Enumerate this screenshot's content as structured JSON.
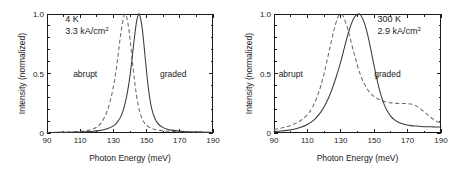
{
  "figure": {
    "panel_count": 2,
    "background": "#ffffff"
  },
  "chart_data": [
    {
      "type": "line",
      "panel": "left",
      "title": "",
      "xlabel": "Photon Energy (meV)",
      "ylabel": "Intensity (normalized)",
      "xlim": [
        90,
        190
      ],
      "ylim": [
        0,
        1.0
      ],
      "xticks": [
        90,
        110,
        130,
        150,
        170,
        190
      ],
      "xticklabels": [
        "90",
        "110",
        "130",
        "150",
        "170",
        "190"
      ],
      "yticks": [
        0,
        0.5,
        1.0
      ],
      "yticklabels": [
        "0",
        "0.5",
        "1.0"
      ],
      "minor_ticks": true,
      "grid": false,
      "legend": "inline-annotations",
      "annotations": [
        {
          "text_line1": "4 K",
          "text_line2_base": "3.3 kA/cm",
          "text_line2_sup": "2",
          "x": 101,
          "y": 0.93
        },
        {
          "text": "abrupt",
          "x": 113,
          "y": 0.5
        },
        {
          "text": "graded",
          "x": 166,
          "y": 0.5
        }
      ],
      "series": [
        {
          "name": "abrupt",
          "style": "dashed",
          "color": "#6a6a6a",
          "peak_x": 137.0,
          "peak_y": 1.0,
          "x": [
            90,
            95,
            100,
            105,
            110,
            113,
            116,
            118,
            120,
            122,
            124,
            126,
            128,
            130,
            132,
            134,
            135,
            136,
            137,
            138,
            139,
            140,
            141,
            142,
            143,
            144,
            145,
            146,
            147,
            148,
            149,
            150,
            152,
            154,
            156,
            158,
            160,
            163,
            166,
            170,
            175,
            180,
            185,
            190
          ],
          "y": [
            0.005,
            0.006,
            0.008,
            0.01,
            0.014,
            0.018,
            0.026,
            0.035,
            0.05,
            0.075,
            0.115,
            0.175,
            0.265,
            0.39,
            0.565,
            0.79,
            0.885,
            0.96,
            1.0,
            0.975,
            0.9,
            0.79,
            0.66,
            0.53,
            0.41,
            0.31,
            0.23,
            0.172,
            0.13,
            0.1,
            0.079,
            0.064,
            0.045,
            0.034,
            0.027,
            0.022,
            0.019,
            0.015,
            0.013,
            0.011,
            0.009,
            0.008,
            0.007,
            0.006
          ]
        },
        {
          "name": "graded",
          "style": "solid",
          "color": "#3a3a3a",
          "peak_x": 145.5,
          "peak_y": 1.0,
          "x": [
            90,
            95,
            100,
            105,
            110,
            114,
            118,
            121,
            124,
            127,
            130,
            132,
            134,
            136,
            138,
            140,
            142,
            143,
            144,
            145,
            145.5,
            146,
            147,
            148,
            149,
            150,
            151,
            152,
            153,
            154,
            155,
            156,
            158,
            160,
            162,
            165,
            168,
            172,
            176,
            180,
            185,
            190
          ],
          "y": [
            0.004,
            0.005,
            0.006,
            0.007,
            0.009,
            0.011,
            0.015,
            0.02,
            0.028,
            0.04,
            0.06,
            0.085,
            0.125,
            0.195,
            0.31,
            0.48,
            0.72,
            0.84,
            0.94,
            0.995,
            1.0,
            0.985,
            0.915,
            0.8,
            0.655,
            0.51,
            0.385,
            0.285,
            0.21,
            0.158,
            0.122,
            0.096,
            0.063,
            0.045,
            0.034,
            0.024,
            0.018,
            0.013,
            0.01,
            0.008,
            0.007,
            0.006
          ]
        }
      ]
    },
    {
      "type": "line",
      "panel": "right",
      "title": "",
      "xlabel": "Photon Energy (meV)",
      "ylabel": "Intensity (normalized)",
      "xlim": [
        90,
        190
      ],
      "ylim": [
        0,
        1.0
      ],
      "xticks": [
        90,
        110,
        130,
        150,
        170,
        190
      ],
      "xticklabels": [
        "90",
        "110",
        "130",
        "150",
        "170",
        "190"
      ],
      "yticks": [
        0,
        0.5,
        1.0
      ],
      "yticklabels": [
        "0",
        "0.5",
        "1.0"
      ],
      "minor_ticks": true,
      "grid": false,
      "legend": "inline-annotations",
      "annotations": [
        {
          "text_line1": "300 K",
          "text_line2_base": "2.9 kA/cm",
          "text_line2_sup": "2",
          "x": 152,
          "y": 0.93
        },
        {
          "text": "abrupt",
          "x": 100,
          "y": 0.5
        },
        {
          "text": "graded",
          "x": 158,
          "y": 0.5
        }
      ],
      "series": [
        {
          "name": "abrupt",
          "style": "dashed",
          "color": "#6a6a6a",
          "peak_x": 130.0,
          "peak_y": 1.0,
          "shoulder_x": 170,
          "shoulder_y": 0.25,
          "x": [
            90,
            94,
            98,
            102,
            106,
            110,
            113,
            116,
            118,
            120,
            122,
            124,
            126,
            128,
            129,
            130,
            131,
            132,
            134,
            136,
            138,
            140,
            142,
            144,
            146,
            148,
            150,
            152,
            154,
            156,
            158,
            160,
            163,
            166,
            169,
            172,
            175,
            178,
            181,
            184,
            187,
            190
          ],
          "y": [
            0.03,
            0.04,
            0.055,
            0.075,
            0.105,
            0.155,
            0.215,
            0.31,
            0.395,
            0.5,
            0.625,
            0.75,
            0.87,
            0.965,
            0.99,
            1.0,
            0.99,
            0.965,
            0.88,
            0.775,
            0.665,
            0.565,
            0.48,
            0.415,
            0.365,
            0.33,
            0.305,
            0.288,
            0.275,
            0.265,
            0.258,
            0.253,
            0.249,
            0.248,
            0.248,
            0.243,
            0.228,
            0.2,
            0.165,
            0.13,
            0.1,
            0.08
          ]
        },
        {
          "name": "graded",
          "style": "solid",
          "color": "#3a3a3a",
          "peak_x": 141.0,
          "peak_y": 1.0,
          "x": [
            90,
            94,
            98,
            102,
            106,
            110,
            114,
            118,
            121,
            124,
            127,
            130,
            132,
            134,
            136,
            138,
            140,
            141,
            142,
            144,
            146,
            148,
            150,
            152,
            154,
            156,
            158,
            160,
            162,
            164,
            166,
            169,
            172,
            175,
            178,
            181,
            184,
            187,
            190
          ],
          "y": [
            0.012,
            0.016,
            0.022,
            0.032,
            0.048,
            0.072,
            0.11,
            0.175,
            0.245,
            0.34,
            0.46,
            0.6,
            0.71,
            0.815,
            0.905,
            0.97,
            0.998,
            1.0,
            0.99,
            0.93,
            0.83,
            0.7,
            0.56,
            0.43,
            0.32,
            0.238,
            0.18,
            0.14,
            0.113,
            0.095,
            0.082,
            0.07,
            0.062,
            0.058,
            0.055,
            0.053,
            0.052,
            0.051,
            0.05
          ]
        }
      ]
    }
  ]
}
